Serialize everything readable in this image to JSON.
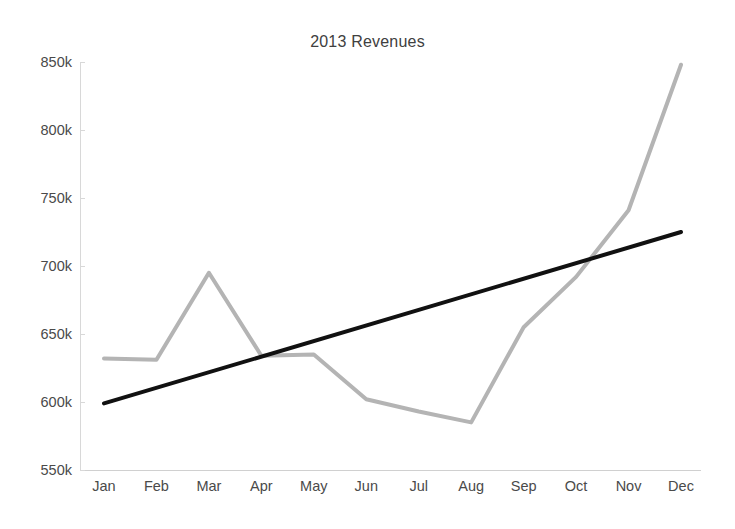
{
  "chart_data": {
    "type": "line",
    "title": "2013 Revenues",
    "xlabel": "",
    "ylabel": "",
    "categories": [
      "Jan",
      "Feb",
      "Mar",
      "Apr",
      "May",
      "Jun",
      "Jul",
      "Aug",
      "Sep",
      "Oct",
      "Nov",
      "Dec"
    ],
    "ylim": [
      550000,
      850000
    ],
    "ytick_values": [
      850000,
      800000,
      750000,
      700000,
      650000,
      600000,
      550000
    ],
    "ytick_labels": [
      "850k",
      "800k",
      "750k",
      "700k",
      "650k",
      "600k",
      "550k"
    ],
    "grid": false,
    "legend": "none",
    "series": [
      {
        "name": "Revenue",
        "kind": "data",
        "color": "#b4b4b4",
        "width": 4,
        "values": [
          632000,
          631000,
          695000,
          634000,
          635000,
          602000,
          593000,
          585000,
          655000,
          692000,
          741000,
          848000
        ]
      },
      {
        "name": "Trendline",
        "kind": "trend",
        "color": "#111111",
        "width": 4,
        "values": [
          599000,
          610500,
          622000,
          633500,
          645000,
          656500,
          668000,
          679500,
          691000,
          702500,
          714000,
          725000
        ]
      }
    ]
  }
}
